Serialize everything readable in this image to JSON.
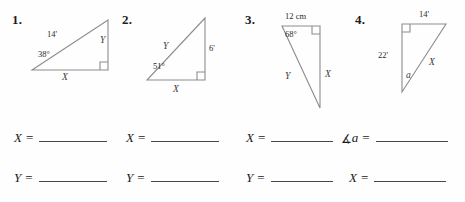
{
  "worksheet": {
    "problems": [
      {
        "number": "1.",
        "labels": {
          "hypotenuse": "14'",
          "angle": "38°",
          "vertical": "Y",
          "base": "X"
        }
      },
      {
        "number": "2.",
        "labels": {
          "hypotenuse": "Y",
          "angle": "51°",
          "vertical": "6'",
          "base": "X"
        }
      },
      {
        "number": "3.",
        "labels": {
          "top": "12 cm",
          "angle": "68°",
          "hypotenuse": "Y",
          "vertical": "X"
        }
      },
      {
        "number": "4.",
        "labels": {
          "top": "14'",
          "vertical": "22'",
          "hypotenuse": "X",
          "angle": "a"
        }
      }
    ],
    "answers": [
      {
        "row1_label": "X",
        "row1_equals": "=",
        "row2_label": "Y",
        "row2_equals": "="
      },
      {
        "row1_label": "X",
        "row1_equals": "=",
        "row2_label": "Y",
        "row2_equals": "="
      },
      {
        "row1_label": "X",
        "row1_equals": "=",
        "row2_label": "Y",
        "row2_equals": "="
      },
      {
        "row1_angle_symbol": "∡",
        "row1_label": "a",
        "row1_equals": "=",
        "row2_label": "X",
        "row2_equals": "="
      }
    ],
    "colors": {
      "line": "#8c8c8c",
      "text": "#1a1a1a",
      "blank": "#4a4a4a"
    }
  }
}
